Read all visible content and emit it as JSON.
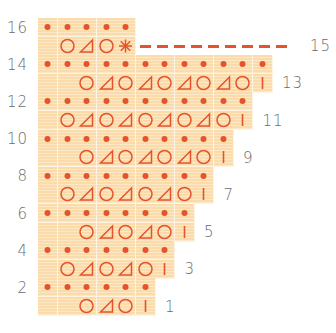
{
  "chart_data": {
    "type": "table",
    "legend": {
      "dot": "purl / wrong-side knit dot",
      "O": "yarn over",
      "triangle": "decrease",
      "bar": "knit stitch",
      "asterisk": "end stitch",
      "blank": "empty cell"
    },
    "rows": [
      {
        "row": 16,
        "label_side": "left",
        "cells": [
          "dot",
          "dot",
          "dot",
          "dot",
          "dot"
        ]
      },
      {
        "row": 15,
        "label_side": "right",
        "cells": [
          "blank",
          "O",
          "triangle",
          "O",
          "asterisk"
        ],
        "dashed_leader": true
      },
      {
        "row": 14,
        "label_side": "left",
        "cells": [
          "dot",
          "dot",
          "dot",
          "dot",
          "dot",
          "dot",
          "dot",
          "dot",
          "dot",
          "dot",
          "dot",
          "dot"
        ]
      },
      {
        "row": 13,
        "label_side": "right",
        "cells": [
          "blank",
          "blank",
          "O",
          "triangle",
          "O",
          "triangle",
          "O",
          "triangle",
          "O",
          "triangle",
          "O",
          "bar"
        ]
      },
      {
        "row": 12,
        "label_side": "left",
        "cells": [
          "dot",
          "dot",
          "dot",
          "dot",
          "dot",
          "dot",
          "dot",
          "dot",
          "dot",
          "dot",
          "dot"
        ]
      },
      {
        "row": 11,
        "label_side": "right",
        "cells": [
          "blank",
          "O",
          "triangle",
          "O",
          "triangle",
          "O",
          "triangle",
          "O",
          "triangle",
          "O",
          "bar"
        ]
      },
      {
        "row": 10,
        "label_side": "left",
        "cells": [
          "dot",
          "dot",
          "dot",
          "dot",
          "dot",
          "dot",
          "dot",
          "dot",
          "dot",
          "dot"
        ]
      },
      {
        "row": 9,
        "label_side": "right",
        "cells": [
          "blank",
          "blank",
          "O",
          "triangle",
          "O",
          "triangle",
          "O",
          "triangle",
          "O",
          "bar"
        ]
      },
      {
        "row": 8,
        "label_side": "left",
        "cells": [
          "dot",
          "dot",
          "dot",
          "dot",
          "dot",
          "dot",
          "dot",
          "dot",
          "dot"
        ]
      },
      {
        "row": 7,
        "label_side": "right",
        "cells": [
          "blank",
          "O",
          "triangle",
          "O",
          "triangle",
          "O",
          "triangle",
          "O",
          "bar"
        ]
      },
      {
        "row": 6,
        "label_side": "left",
        "cells": [
          "dot",
          "dot",
          "dot",
          "dot",
          "dot",
          "dot",
          "dot",
          "dot"
        ]
      },
      {
        "row": 5,
        "label_side": "right",
        "cells": [
          "blank",
          "blank",
          "O",
          "triangle",
          "O",
          "triangle",
          "O",
          "bar"
        ]
      },
      {
        "row": 4,
        "label_side": "left",
        "cells": [
          "dot",
          "dot",
          "dot",
          "dot",
          "dot",
          "dot",
          "dot"
        ]
      },
      {
        "row": 3,
        "label_side": "right",
        "cells": [
          "blank",
          "O",
          "triangle",
          "O",
          "triangle",
          "O",
          "bar"
        ]
      },
      {
        "row": 2,
        "label_side": "left",
        "cells": [
          "dot",
          "dot",
          "dot",
          "dot",
          "dot",
          "dot"
        ]
      },
      {
        "row": 1,
        "label_side": "right",
        "cells": [
          "blank",
          "blank",
          "O",
          "triangle",
          "O",
          "bar"
        ]
      }
    ]
  },
  "colors": {
    "symbol": "#e4532c",
    "cell": "#fbdba9",
    "label": "#6b6b6b"
  },
  "layout": {
    "origin_x": 38,
    "origin_y": 18,
    "cell_w": 19.5,
    "cell_h": 18.6,
    "dash_end_x": 300,
    "row15_label_x": 310
  }
}
